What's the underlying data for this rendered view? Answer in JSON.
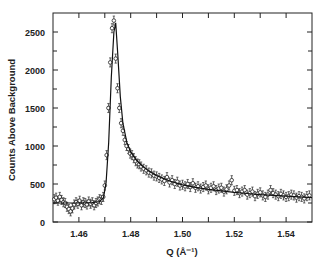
{
  "chart_data": {
    "type": "scatter",
    "title": "",
    "xlabel": "Q (Å⁻¹)",
    "ylabel": "Counts Above Background",
    "xlim": [
      1.45,
      1.55
    ],
    "ylim": [
      0,
      2750
    ],
    "xticks": [
      1.46,
      1.48,
      1.5,
      1.52,
      1.54
    ],
    "xtick_labels": [
      "1.46",
      "1.48",
      "1.50",
      "1.52",
      "1.54"
    ],
    "x_minor_ticks": [
      1.47,
      1.49,
      1.51,
      1.53
    ],
    "yticks": [
      0,
      500,
      1000,
      1500,
      2000,
      2500
    ],
    "ytick_labels": [
      "0",
      "500",
      "1000",
      "1500",
      "2000",
      "2500"
    ],
    "y_minor_ticks": [
      250,
      750,
      1250,
      1750,
      2250
    ],
    "grid": false,
    "legend": null,
    "series": [
      {
        "name": "data",
        "style": "open-circle markers with error bars",
        "x": [
          1.4505,
          1.4512,
          1.4519,
          1.4526,
          1.4533,
          1.454,
          1.4547,
          1.4554,
          1.4561,
          1.4568,
          1.4575,
          1.4582,
          1.4589,
          1.4596,
          1.4603,
          1.461,
          1.4617,
          1.4624,
          1.4631,
          1.4638,
          1.4645,
          1.4652,
          1.4659,
          1.4666,
          1.4673,
          1.468,
          1.4687,
          1.4694,
          1.47,
          1.4707,
          1.4714,
          1.4721,
          1.4728,
          1.4735,
          1.4742,
          1.4749,
          1.4756,
          1.4763,
          1.477,
          1.4777,
          1.4784,
          1.4791,
          1.4798,
          1.4805,
          1.4812,
          1.4819,
          1.4826,
          1.4833,
          1.484,
          1.485,
          1.486,
          1.487,
          1.488,
          1.489,
          1.49,
          1.491,
          1.492,
          1.493,
          1.494,
          1.495,
          1.496,
          1.497,
          1.498,
          1.499,
          1.5,
          1.501,
          1.502,
          1.503,
          1.504,
          1.505,
          1.506,
          1.507,
          1.508,
          1.509,
          1.51,
          1.511,
          1.512,
          1.513,
          1.514,
          1.515,
          1.516,
          1.517,
          1.518,
          1.519,
          1.52,
          1.521,
          1.522,
          1.523,
          1.524,
          1.525,
          1.526,
          1.527,
          1.528,
          1.529,
          1.53,
          1.531,
          1.532,
          1.533,
          1.534,
          1.535,
          1.536,
          1.537,
          1.538,
          1.539,
          1.54,
          1.541,
          1.542,
          1.543,
          1.544,
          1.545,
          1.546,
          1.547,
          1.548,
          1.549
        ],
        "y": [
          300,
          320,
          280,
          330,
          290,
          260,
          250,
          200,
          170,
          140,
          180,
          230,
          260,
          240,
          280,
          220,
          260,
          250,
          230,
          270,
          240,
          260,
          220,
          250,
          270,
          300,
          290,
          330,
          480,
          880,
          1500,
          2100,
          2550,
          2650,
          2150,
          1760,
          1500,
          1300,
          1200,
          1080,
          1000,
          960,
          900,
          880,
          840,
          800,
          770,
          760,
          730,
          700,
          680,
          650,
          640,
          610,
          600,
          580,
          560,
          540,
          590,
          520,
          550,
          500,
          530,
          480,
          490,
          470,
          500,
          460,
          510,
          450,
          470,
          440,
          460,
          480,
          430,
          450,
          470,
          420,
          440,
          450,
          400,
          430,
          480,
          550,
          410,
          420,
          380,
          400,
          420,
          360,
          380,
          400,
          340,
          370,
          390,
          350,
          330,
          360,
          420,
          380,
          360,
          340,
          370,
          350,
          330,
          340,
          360,
          350,
          320,
          340,
          330,
          310,
          340,
          350
        ],
        "yerr": 40
      },
      {
        "name": "fit",
        "style": "solid line",
        "x": [
          1.45,
          1.455,
          1.46,
          1.465,
          1.468,
          1.4695,
          1.4705,
          1.4715,
          1.4725,
          1.4735,
          1.4742,
          1.475,
          1.476,
          1.477,
          1.4785,
          1.48,
          1.482,
          1.484,
          1.487,
          1.49,
          1.495,
          1.5,
          1.505,
          1.51,
          1.515,
          1.52,
          1.525,
          1.53,
          1.535,
          1.54,
          1.545,
          1.55
        ],
        "y": [
          250,
          250,
          250,
          255,
          270,
          320,
          520,
          1050,
          1900,
          2500,
          2620,
          2200,
          1650,
          1300,
          1050,
          920,
          820,
          750,
          670,
          610,
          540,
          490,
          455,
          430,
          410,
          390,
          375,
          360,
          350,
          340,
          330,
          320
        ]
      }
    ]
  }
}
